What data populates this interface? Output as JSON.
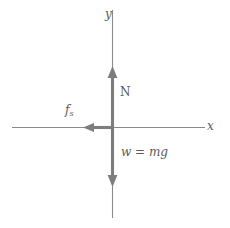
{
  "figure": {
    "type": "free-body-diagram",
    "title": "",
    "width": 230,
    "height": 228,
    "background": "#ffffff",
    "axis_color": "#8a8a8a",
    "vector_color": "#7d7d7d",
    "text_color": "#5a5a5a"
  },
  "axes": {
    "origin": {
      "x": 112,
      "y": 127
    },
    "x_axis": {
      "label": "x",
      "italic": true,
      "from_x": 12,
      "to_x": 205,
      "y": 127
    },
    "y_axis": {
      "label": "y",
      "italic": true,
      "from_y": 10,
      "to_y": 218,
      "x": 112
    }
  },
  "vectors": [
    {
      "name": "normal-force",
      "label": "N",
      "italic": false,
      "direction": "up",
      "tail": {
        "x": 112,
        "y": 127
      },
      "tip": {
        "x": 112,
        "y": 68
      },
      "length_px": 59
    },
    {
      "name": "weight-force",
      "label": "w = mg",
      "italic": true,
      "direction": "down",
      "tail": {
        "x": 112,
        "y": 127
      },
      "tip": {
        "x": 112,
        "y": 185
      },
      "length_px": 58
    },
    {
      "name": "static-friction-force",
      "label_base": "f",
      "label_sub": "s",
      "italic": true,
      "direction": "left",
      "tail": {
        "x": 112,
        "y": 127
      },
      "tip": {
        "x": 85,
        "y": 127
      },
      "length_px": 27
    }
  ],
  "labels": {
    "y_axis": "y",
    "x_axis": "x",
    "normal": "N",
    "weight": "w = mg",
    "friction_base": "f",
    "friction_sub": "s"
  }
}
